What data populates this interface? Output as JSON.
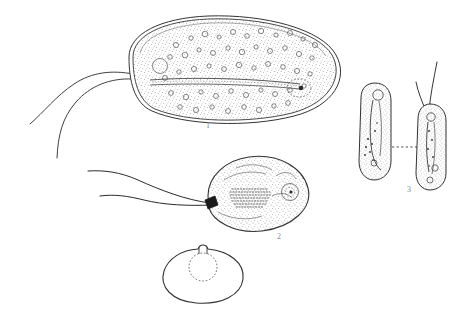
{
  "plate": {
    "title": "",
    "background_color": "#ffffff",
    "ink_color": "#222222",
    "stipple_color": "#3a3a3a",
    "label_color": "#8a8a8a"
  },
  "figures": [
    {
      "id": "figure-1",
      "label": "1",
      "name": "large-ovoid-trophozoite",
      "description": "Large elongate ovoid cell with double membrane outline, dense stippled cytoplasm with many small vacuoles, a longitudinal axostyle running the length of the body, posterior nucleus, and two anterior flagella",
      "flagella_count": 2,
      "has_axostyle": true,
      "has_nucleus": true,
      "label_position": {
        "x": 206,
        "y": 121
      }
    },
    {
      "id": "figure-2",
      "label": "2",
      "name": "pear-shaped-trophozoite",
      "description": "Pear or teardrop shaped cell with stippled cytoplasm, a striated band of transverse dashes centrally, a posterior nucleus with a ring, a dark basal body at the anterior and two long flagella",
      "flagella_count": 2,
      "has_striated_band": true,
      "has_nucleus": true,
      "label_position": {
        "x": 277,
        "y": 232
      }
    },
    {
      "id": "figure-3",
      "label": "3",
      "name": "dividing-pair",
      "description": "Two narrow elongate daughter cells side by side joined by a horizontal dotted line; the left cell bears a small anterior vesicle and an internal elongate body, the right cell bears two long anterior flagella",
      "cells": 2,
      "connector": "dotted-line",
      "flagella_count": 2,
      "label_position": {
        "x": 407,
        "y": 185
      }
    },
    {
      "id": "figure-cyst",
      "label": "",
      "name": "rounded-cyst",
      "description": "Unlabeled rounded cyst form with a small notch at the top and a dotted circular inner outline",
      "has_dotted_inner_circle": true,
      "has_apical_notch": true
    }
  ]
}
